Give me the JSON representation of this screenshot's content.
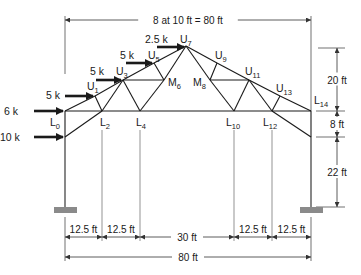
{
  "figure": {
    "type": "truss-frame",
    "colors": {
      "member": "#1a1a1a",
      "dimension": "#333333",
      "support": "#8a8a8a",
      "column": "#555555"
    }
  },
  "nodes": {
    "L0": {
      "x": 65,
      "y": 111,
      "name": "L",
      "sub": "0",
      "lx": 50,
      "ly": 126
    },
    "L2": {
      "x": 102,
      "y": 111,
      "name": "L",
      "sub": "2",
      "lx": 100,
      "ly": 126
    },
    "L4": {
      "x": 140,
      "y": 111,
      "name": "L",
      "sub": "4",
      "lx": 136,
      "ly": 126
    },
    "L10": {
      "x": 234,
      "y": 111,
      "name": "L",
      "sub": "10",
      "lx": 226,
      "ly": 126
    },
    "L12": {
      "x": 272,
      "y": 111,
      "name": "L",
      "sub": "12",
      "lx": 263,
      "ly": 126
    },
    "L14": {
      "x": 311,
      "y": 111,
      "name": "L",
      "sub": "14",
      "lx": 314,
      "ly": 104
    },
    "U1": {
      "x": 95,
      "y": 96,
      "name": "U",
      "sub": "1",
      "lx": 87,
      "ly": 90
    },
    "U3": {
      "x": 123,
      "y": 80,
      "name": "U",
      "sub": "3",
      "lx": 116,
      "ly": 75
    },
    "U5": {
      "x": 154,
      "y": 63,
      "name": "U",
      "sub": "5",
      "lx": 148,
      "ly": 59
    },
    "U7": {
      "x": 186,
      "y": 46,
      "name": "U",
      "sub": "7",
      "lx": 180,
      "ly": 43
    },
    "U9": {
      "x": 217,
      "y": 63,
      "name": "U",
      "sub": "9",
      "lx": 215,
      "ly": 59
    },
    "U11": {
      "x": 249,
      "y": 80,
      "name": "U",
      "sub": "11",
      "lx": 245,
      "ly": 75
    },
    "U13": {
      "x": 280,
      "y": 96,
      "name": "U",
      "sub": "13",
      "lx": 276,
      "ly": 92
    },
    "M6": {
      "x": 164,
      "y": 80,
      "name": "M",
      "sub": "6",
      "lx": 168,
      "ly": 86
    },
    "M8": {
      "x": 210,
      "y": 80,
      "name": "M",
      "sub": "8",
      "lx": 193,
      "ly": 86
    },
    "KL": {
      "x": 65,
      "y": 137
    },
    "KR": {
      "x": 311,
      "y": 137
    },
    "SL": {
      "x": 65,
      "y": 207
    },
    "SR": {
      "x": 311,
      "y": 207
    }
  },
  "members": [
    [
      "L0",
      "U1"
    ],
    [
      "U1",
      "U3"
    ],
    [
      "U3",
      "U5"
    ],
    [
      "U5",
      "U7"
    ],
    [
      "U7",
      "U9"
    ],
    [
      "U9",
      "U11"
    ],
    [
      "U11",
      "U13"
    ],
    [
      "U13",
      "L14"
    ],
    [
      "L0",
      "L14"
    ],
    [
      "U1",
      "L2"
    ],
    [
      "L2",
      "U3"
    ],
    [
      "U3",
      "L4"
    ],
    [
      "U3",
      "M6"
    ],
    [
      "U5",
      "M6"
    ],
    [
      "L4",
      "M6"
    ],
    [
      "M6",
      "U7"
    ],
    [
      "U7",
      "M8"
    ],
    [
      "M8",
      "U9"
    ],
    [
      "M8",
      "U11"
    ],
    [
      "M8",
      "L10"
    ],
    [
      "L10",
      "U11"
    ],
    [
      "U11",
      "L12"
    ],
    [
      "L12",
      "U13"
    ],
    [
      "KL",
      "L2"
    ],
    [
      "KR",
      "L12"
    ],
    [
      "L0",
      "KL"
    ],
    [
      "L14",
      "KR"
    ]
  ],
  "columns": [
    [
      "KL",
      "SL"
    ],
    [
      "KR",
      "SR"
    ]
  ],
  "supports": [
    {
      "x": 54,
      "y": 207,
      "w": 23,
      "h": 6
    },
    {
      "x": 300,
      "y": 207,
      "w": 23,
      "h": 6
    }
  ],
  "loads": [
    {
      "label": "6 k",
      "x1": 34,
      "x2": 63,
      "y": 111,
      "tx": 4,
      "ty": 115
    },
    {
      "label": "10 k",
      "x1": 34,
      "x2": 63,
      "y": 137,
      "tx": 0,
      "ty": 141
    },
    {
      "label": "5 k",
      "x1": 65,
      "x2": 93,
      "y": 96,
      "tx": 46,
      "ty": 99
    },
    {
      "label": "5 k",
      "x1": 96,
      "x2": 121,
      "y": 80,
      "tx": 90,
      "ty": 75
    },
    {
      "label": "5 k",
      "x1": 126,
      "x2": 152,
      "y": 63,
      "tx": 120,
      "ty": 59
    },
    {
      "label": "2.5 k",
      "x1": 157,
      "x2": 184,
      "y": 47,
      "tx": 145,
      "ty": 43
    }
  ],
  "dimensions": {
    "top": {
      "label": "8 at 10 ft = 80 ft",
      "y": 20,
      "x1": 65,
      "x2": 311
    },
    "right": [
      {
        "label": "20 ft",
        "x": 337,
        "y1": 48,
        "y2": 111
      },
      {
        "label": "8 ft",
        "x": 337,
        "y1": 111,
        "y2": 137
      },
      {
        "label": "22 ft",
        "x": 337,
        "y1": 137,
        "y2": 207
      }
    ],
    "bottom_row1": [
      {
        "label": "12.5 ft",
        "x1": 65,
        "x2": 102
      },
      {
        "label": "12.5 ft",
        "x1": 102,
        "x2": 140
      },
      {
        "label": "30 ft",
        "x1": 140,
        "x2": 234
      },
      {
        "label": "12.5 ft",
        "x1": 234,
        "x2": 272
      },
      {
        "label": "12.5 ft",
        "x1": 272,
        "x2": 311
      }
    ],
    "bottom_row1_y": 237,
    "bottom_row2": {
      "label": "80 ft",
      "x1": 65,
      "x2": 311,
      "y": 257
    }
  }
}
